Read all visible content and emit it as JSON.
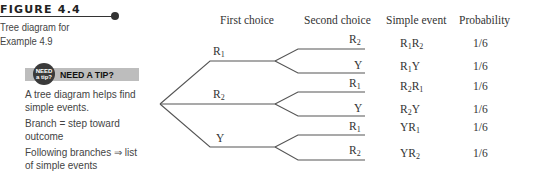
{
  "figure": {
    "title": "FIGURE 4.4",
    "caption": "Tree diagram for Example 4.9"
  },
  "tip": {
    "badge_line1": "NEED",
    "badge_line2": "a tip?",
    "label": "NEED A TIP?",
    "notes": [
      "A tree diagram helps find simple events.",
      "Branch = step toward outcome",
      "Following branches ⇒ list of simple events"
    ]
  },
  "columns": {
    "first": "First choice",
    "second": "Second choice",
    "event": "Simple event",
    "probability": "Probability"
  },
  "first_choices": [
    {
      "base": "R",
      "sub": "1"
    },
    {
      "base": "R",
      "sub": "2"
    },
    {
      "base": "Y",
      "sub": ""
    }
  ],
  "rows": [
    {
      "second_base": "R",
      "second_sub": "2",
      "event": [
        [
          "R",
          "1"
        ],
        [
          "R",
          "2"
        ]
      ],
      "probability": "1/6"
    },
    {
      "second_base": "Y",
      "second_sub": "",
      "event": [
        [
          "R",
          "1"
        ],
        [
          "Y",
          ""
        ]
      ],
      "probability": "1/6"
    },
    {
      "second_base": "R",
      "second_sub": "1",
      "event": [
        [
          "R",
          "2"
        ],
        [
          "R",
          "1"
        ]
      ],
      "probability": "1/6"
    },
    {
      "second_base": "Y",
      "second_sub": "",
      "event": [
        [
          "R",
          "2"
        ],
        [
          "Y",
          ""
        ]
      ],
      "probability": "1/6"
    },
    {
      "second_base": "R",
      "second_sub": "1",
      "event": [
        [
          "Y",
          ""
        ],
        [
          "R",
          "1"
        ]
      ],
      "probability": "1/6"
    },
    {
      "second_base": "R",
      "second_sub": "2",
      "event": [
        [
          "Y",
          ""
        ],
        [
          "R",
          "2"
        ]
      ],
      "probability": "1/6"
    }
  ],
  "colors": {
    "line": "#555555",
    "text": "#333333",
    "tip_bar": "#bdbdbd",
    "badge": "#3a3a3a"
  }
}
